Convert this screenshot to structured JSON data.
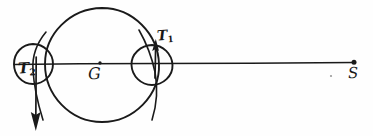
{
  "figure": {
    "kind": "hand-drawn-diagram",
    "background_color": "#fefefe",
    "ink_color": "#1a1a1a",
    "width": 373,
    "height": 136
  },
  "labels": {
    "center": {
      "text": "G",
      "sub": ""
    },
    "left_bulge": {
      "text": "T",
      "sub": "2"
    },
    "right_bulge": {
      "text": "T",
      "sub": "1"
    },
    "far_point": {
      "text": "S",
      "sub": ""
    }
  },
  "shapes": {
    "main_circle": {
      "name": "main-body-circle",
      "cx": 102,
      "cy": 65,
      "r": 57
    },
    "left_circle": {
      "name": "left-tidal-bulge-circle",
      "cx": 33,
      "cy": 64,
      "r": 20
    },
    "right_circle": {
      "name": "right-tidal-bulge-circle",
      "cx": 152,
      "cy": 65,
      "r": 21
    },
    "axis_line": {
      "name": "central-axis-line",
      "x1": 14,
      "y1": 64,
      "x2": 355,
      "y2": 63
    },
    "center_dot": {
      "cx": 100,
      "cy": 63,
      "r": 1.6
    },
    "far_dot": {
      "cx": 354,
      "cy": 62,
      "r": 2.4
    },
    "down_arrow": {
      "name": "left-force-arrow-down",
      "x": 36,
      "y1": 58,
      "y2": 126
    },
    "up_arrow": {
      "name": "right-force-arrow-up",
      "x": 155,
      "y1": 78,
      "y2": 40
    },
    "stray_mark": {
      "cx": 331,
      "cy": 76,
      "r": 1.1
    }
  }
}
